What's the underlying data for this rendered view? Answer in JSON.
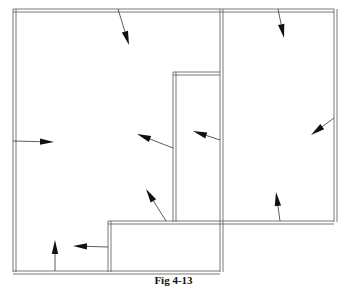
{
  "figure": {
    "caption": "Fig 4-13",
    "colors": {
      "wall": "#6a6a6a",
      "arrow": "#111111",
      "background": "#ffffff"
    }
  },
  "walls": [
    {
      "id": "outer-top",
      "x1": 13,
      "y1": 9,
      "x2": 334,
      "y2": 9
    },
    {
      "id": "outer-left",
      "x1": 13,
      "y1": 9,
      "x2": 13,
      "y2": 272
    },
    {
      "id": "outer-right",
      "x1": 334,
      "y1": 9,
      "x2": 334,
      "y2": 222
    },
    {
      "id": "middle-wall",
      "x1": 220,
      "y1": 9,
      "x2": 220,
      "y2": 272
    },
    {
      "id": "inner-box-top",
      "x1": 173,
      "y1": 72,
      "x2": 220,
      "y2": 72
    },
    {
      "id": "inner-box-left",
      "x1": 173,
      "y1": 72,
      "x2": 173,
      "y2": 222
    },
    {
      "id": "shelf",
      "x1": 108,
      "y1": 221,
      "x2": 334,
      "y2": 221
    },
    {
      "id": "lower-box-left",
      "x1": 108,
      "y1": 221,
      "x2": 108,
      "y2": 272
    },
    {
      "id": "bottom",
      "x1": 13,
      "y1": 271,
      "x2": 220,
      "y2": 271
    }
  ],
  "arrows": [
    {
      "id": "arrow-top-left-room",
      "from": [
        118,
        9
      ],
      "to": [
        129,
        45
      ]
    },
    {
      "id": "arrow-top-right-room",
      "from": [
        278,
        9
      ],
      "to": [
        284,
        38
      ]
    },
    {
      "id": "arrow-left-wall",
      "from": [
        13,
        141
      ],
      "to": [
        54,
        142
      ]
    },
    {
      "id": "arrow-inner-box-left",
      "from": [
        173,
        148
      ],
      "to": [
        137,
        134
      ]
    },
    {
      "id": "arrow-middle-wall",
      "from": [
        220,
        140
      ],
      "to": [
        193,
        131
      ]
    },
    {
      "id": "arrow-right-wall",
      "from": [
        334,
        118
      ],
      "to": [
        311,
        135
      ]
    },
    {
      "id": "arrow-shelf-up-left",
      "from": [
        166,
        221
      ],
      "to": [
        146,
        189
      ]
    },
    {
      "id": "arrow-shelf-up-right",
      "from": [
        280,
        221
      ],
      "to": [
        276,
        192
      ]
    },
    {
      "id": "arrow-bottom-up",
      "from": [
        55,
        271
      ],
      "to": [
        55,
        240
      ]
    },
    {
      "id": "arrow-lower-box-left",
      "from": [
        108,
        247
      ],
      "to": [
        73,
        246
      ]
    }
  ]
}
